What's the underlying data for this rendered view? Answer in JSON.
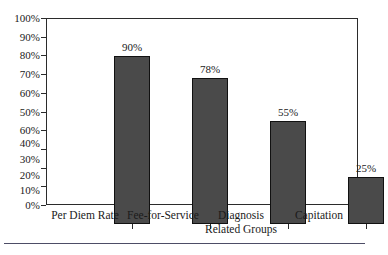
{
  "chart_data": {
    "type": "bar",
    "title": "",
    "subtitle": "",
    "xlabel": "",
    "ylabel": "",
    "categories": [
      "Per Diem Rate",
      "Fee-for-Service",
      "Diagnosis Related Groups",
      "Capitation"
    ],
    "category_lines": [
      [
        "Per Diem Rate"
      ],
      [
        "Fee-for-Service"
      ],
      [
        "Diagnosis",
        "Related Groups"
      ],
      [
        "Capitation"
      ]
    ],
    "values": [
      90,
      78,
      55,
      25
    ],
    "value_labels": [
      "90%",
      "78%",
      "55%",
      "25%"
    ],
    "ylim": [
      0,
      100
    ],
    "ytick_values": [
      100,
      90,
      80,
      70,
      60,
      50,
      40,
      30,
      20,
      10,
      0
    ],
    "ytick_labels": [
      "100%",
      "90%",
      "80%",
      "70%",
      "60%",
      "50%",
      "60%",
      "40%",
      "30%",
      "20%",
      "10%",
      "0%"
    ],
    "ytick_label_positions": [
      100,
      90,
      80,
      70,
      60,
      50,
      40,
      33.2,
      24.6,
      16.2,
      8,
      0
    ],
    "grid": false,
    "legend": false,
    "legend_position": "none",
    "annotations": [],
    "bar_color": "#4a4a4a",
    "bar_edge_color": "#111111",
    "axis_color": "#2b2b2b",
    "text_color": "#1a1a1a",
    "background_color": "#ffffff",
    "rule_color": "#4d4d66"
  }
}
